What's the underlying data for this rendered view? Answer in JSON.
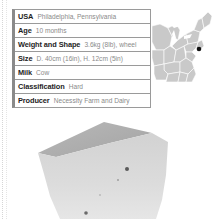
{
  "facts": [
    {
      "label": "USA",
      "value": "Philadelphia, Pennsylvania"
    },
    {
      "label": "Age",
      "value": "10 months"
    },
    {
      "label": "Weight and Shape",
      "value": "3.6kg (8lb), wheel"
    },
    {
      "label": "Size",
      "value": "D. 40cm (16in), H. 12cm (5in)"
    },
    {
      "label": "Milk",
      "value": "Cow"
    },
    {
      "label": "Classification",
      "value": "Hard"
    },
    {
      "label": "Producer",
      "value": "Necessity Farm and Dairy"
    }
  ],
  "map": {
    "region": "Eastern United States",
    "marker": "Philadelphia, Pennsylvania",
    "marker_color": "#111111",
    "land_color": "#c8c8c8",
    "border_color": "#ffffff"
  },
  "image": {
    "subject": "wedge of hard cow's milk cheese",
    "color": "#d9d9d9"
  }
}
